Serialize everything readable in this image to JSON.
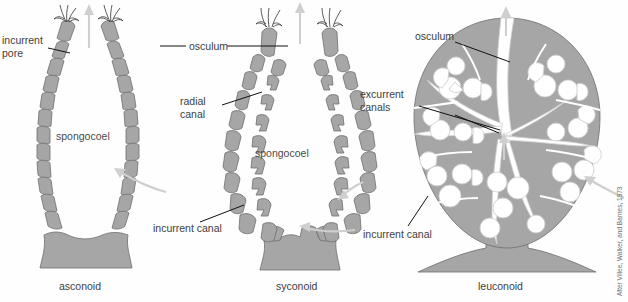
{
  "figure": {
    "credit": "After Villee, Walker, and Barnes, 1973",
    "background_color": "#fefefe",
    "tissue_color": "#a6a6a6",
    "tissue_outline_color": "#6f6f6f",
    "leader_color": "#111111",
    "flow_arrow_color": "#cfcfcf",
    "text_color": "#404040"
  },
  "panels": [
    {
      "id": "asconoid",
      "caption": "asconoid",
      "inner_labels": [
        {
          "name": "spongocoel",
          "text": "spongocoel"
        }
      ],
      "callouts": [
        {
          "name": "incurrent-pore",
          "line1": "incurrent",
          "line2": "pore"
        }
      ]
    },
    {
      "id": "syconoid",
      "caption": "syconoid",
      "inner_labels": [
        {
          "name": "spongocoel",
          "text": "spongocoel"
        }
      ],
      "callouts": [
        {
          "name": "osculum",
          "line1": "osculum",
          "line2": ""
        },
        {
          "name": "radial-canal",
          "line1": "radial",
          "line2": "canal"
        },
        {
          "name": "incurrent-canal",
          "line1": "incurrent canal",
          "line2": ""
        }
      ]
    },
    {
      "id": "leuconoid",
      "caption": "leuconoid",
      "inner_labels": [],
      "callouts": [
        {
          "name": "osculum",
          "line1": "osculum",
          "line2": ""
        },
        {
          "name": "excurrent-canals",
          "line1": "excurrent",
          "line2": "canals"
        },
        {
          "name": "incurrent-canal",
          "line1": "incurrent canal",
          "line2": ""
        }
      ]
    }
  ],
  "labels": {
    "incurrent_pore_l1": "incurrent",
    "incurrent_pore_l2": "pore",
    "osculum_sycon": "osculum",
    "radial_canal_l1": "radial",
    "radial_canal_l2": "canal",
    "spongocoel_ascon": "spongocoel",
    "spongocoel_sycon": "spongocoel",
    "incurrent_canal_sycon": "incurrent canal",
    "osculum_leucon": "osculum",
    "excurrent_canals_l1": "excurrent",
    "excurrent_canals_l2": "canals",
    "incurrent_canal_leucon": "incurrent canal",
    "caption_ascon": "asconoid",
    "caption_sycon": "syconoid",
    "caption_leucon": "leuconoid",
    "credit": "After Villee, Walker, and Barnes, 1973"
  }
}
